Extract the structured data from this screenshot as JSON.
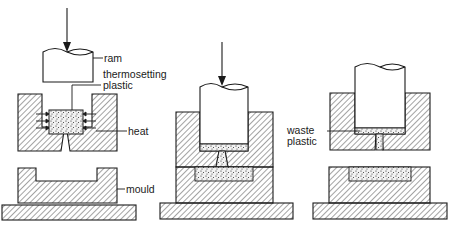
{
  "diagram": {
    "stages": [
      {
        "id": "stage-1",
        "description": "Ram above open mould; plastic heated in top mould"
      },
      {
        "id": "stage-2",
        "description": "Ram pressed down; plastic forced into mould cavity"
      },
      {
        "id": "stage-3",
        "description": "Ram retracted slightly; waste plastic remains in top mould"
      }
    ],
    "labels": {
      "ram": "ram",
      "thermosetting": "thermosetting",
      "plastic": "plastic",
      "heat": "heat",
      "mould": "mould",
      "waste": "waste",
      "waste_plastic": "plastic"
    },
    "colors": {
      "line": "#1a1a1a",
      "background": "#ffffff",
      "hatch": "#333333",
      "plastic_fill": "#e8e8e8"
    }
  }
}
